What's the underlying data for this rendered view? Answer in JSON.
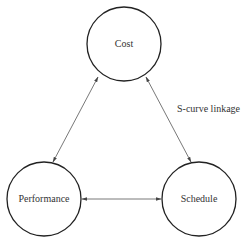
{
  "diagram": {
    "nodes": [
      {
        "id": "cost",
        "label": "Cost",
        "cx": 124,
        "cy": 44,
        "r": 37
      },
      {
        "id": "performance",
        "label": "Performance",
        "cx": 44,
        "cy": 199,
        "r": 37
      },
      {
        "id": "schedule",
        "label": "Schedule",
        "cx": 199,
        "cy": 199,
        "r": 37
      }
    ],
    "edges": [
      {
        "from": "cost",
        "to": "performance",
        "bidirectional": true
      },
      {
        "from": "cost",
        "to": "schedule",
        "bidirectional": true
      },
      {
        "from": "performance",
        "to": "schedule",
        "bidirectional": true
      }
    ],
    "annotation": "S-curve linkage",
    "colors": {
      "stroke": "#222222",
      "edge": "#555555",
      "text": "#333333"
    }
  }
}
